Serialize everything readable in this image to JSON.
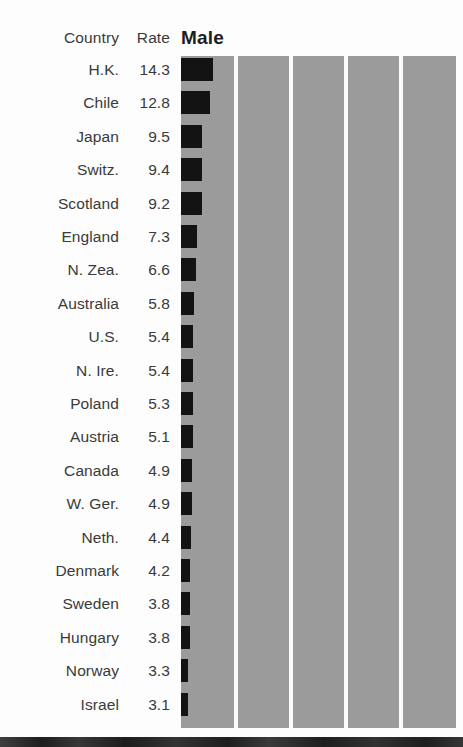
{
  "table": {
    "header": {
      "country_label": "Country",
      "rate_label": "Rate"
    }
  },
  "panel": {
    "title": "Male"
  },
  "chart_data": {
    "type": "bar",
    "orientation": "horizontal",
    "title": "Male",
    "xlabel": "",
    "ylabel": "Country",
    "value_column_label": "Rate",
    "category_column_label": "Country",
    "grid": true,
    "gridlines_x": [
      0,
      25,
      50,
      75,
      100
    ],
    "legend": "none",
    "xlim": [
      0,
      16
    ],
    "bar_color": "#131313",
    "panel_color": "#9b9b9b",
    "gridline_color": "#fbfbfb",
    "categories": [
      "H.K.",
      "Chile",
      "Japan",
      "Switz.",
      "Scotland",
      "England",
      "N. Zea.",
      "Australia",
      "U.S.",
      "N. Ire.",
      "Poland",
      "Austria",
      "Canada",
      "W. Ger.",
      "Neth.",
      "Denmark",
      "Sweden",
      "Hungary",
      "Norway",
      "Israel"
    ],
    "values": [
      14.3,
      12.8,
      9.5,
      9.4,
      9.2,
      7.3,
      6.6,
      5.8,
      5.4,
      5.4,
      5.3,
      5.1,
      4.9,
      4.9,
      4.4,
      4.2,
      3.8,
      3.8,
      3.3,
      3.1
    ],
    "value_labels": [
      "14.3",
      "12.8",
      "9.5",
      "9.4",
      "9.2",
      "7.3",
      "6.6",
      "5.8",
      "5.4",
      "5.4",
      "5.3",
      "5.1",
      "4.9",
      "4.9",
      "4.4",
      "4.2",
      "3.8",
      "3.8",
      "3.3",
      "3.1"
    ]
  }
}
